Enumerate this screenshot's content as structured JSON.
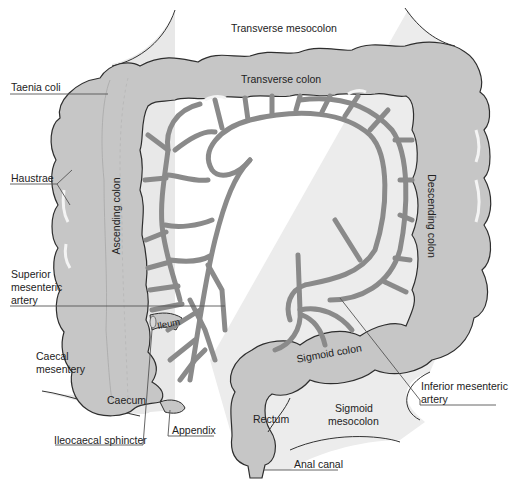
{
  "diagram": {
    "type": "anatomical",
    "colors": {
      "colon_fill": "#c8c8c8",
      "mesentery_fill": "#e6e6e6",
      "artery": "#8c8c8c",
      "outline": "#333333",
      "leader_line": "#555555",
      "background": "#ffffff"
    },
    "labels": {
      "transverse_mesocolon": "Transverse mesocolon",
      "transverse_colon": "Transverse colon",
      "taenia_coli": "Taenia coli",
      "haustrae": "Haustrae",
      "ascending_colon": "Ascending colon",
      "descending_colon": "Descending colon",
      "superior_mesenteric_artery_1": "Superior",
      "superior_mesenteric_artery_2": "mesenteric",
      "superior_mesenteric_artery_3": "artery",
      "ileum": "Ileum",
      "caecal_mesentery_1": "Caecal",
      "caecal_mesentery_2": "mesentery",
      "caecum": "Caecum",
      "appendix": "Appendix",
      "ileocaecal_sphincter": "Ileocaecal sphincter",
      "sigmoid_colon": "Sigmoid colon",
      "inferior_mesenteric_artery_1": "Inferior mesenteric",
      "inferior_mesenteric_artery_2": "artery",
      "rectum": "Rectum",
      "sigmoid_mesocolon_1": "Sigmoid",
      "sigmoid_mesocolon_2": "mesocolon",
      "anal_canal": "Anal canal"
    }
  }
}
